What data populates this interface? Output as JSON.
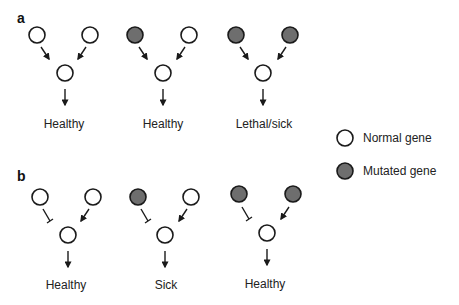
{
  "colors": {
    "normal_fill": "#ffffff",
    "mutated_fill": "#6e6e6e",
    "stroke": "#1a1a1a"
  },
  "panels": [
    {
      "id": "a",
      "label": "a",
      "edge_type": "activation",
      "groups": [
        {
          "top_left": "normal",
          "top_right": "normal",
          "outcome": "Healthy"
        },
        {
          "top_left": "mutated",
          "top_right": "normal",
          "outcome": "Healthy"
        },
        {
          "top_left": "mutated",
          "top_right": "mutated",
          "outcome": "Lethal/sick"
        }
      ]
    },
    {
      "id": "b",
      "label": "b",
      "edge_type": "left-inhibition-right-activation",
      "groups": [
        {
          "top_left": "normal",
          "top_right": "normal",
          "outcome": "Healthy"
        },
        {
          "top_left": "mutated",
          "top_right": "normal",
          "outcome": "Sick"
        },
        {
          "top_left": "mutated",
          "top_right": "mutated",
          "outcome": "Healthy"
        }
      ]
    }
  ],
  "legend": {
    "items": [
      {
        "icon": "normal-gene-circle-icon",
        "label": "Normal gene"
      },
      {
        "icon": "mutated-gene-circle-icon",
        "label": "Mutated gene"
      }
    ]
  }
}
